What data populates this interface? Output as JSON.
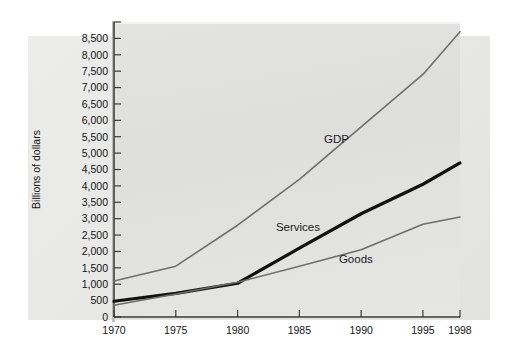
{
  "chart_data": {
    "type": "line",
    "title": "",
    "subtitle": "",
    "xlabel": "",
    "ylabel": "Billions of dollars",
    "x": [
      1970,
      1975,
      1980,
      1985,
      1990,
      1995,
      1998
    ],
    "xlim": [
      1970,
      1998
    ],
    "ylim": [
      0,
      9000
    ],
    "y_tick_step": 500,
    "grid": false,
    "legend_position": "inline-labels",
    "xticks": [
      "1970",
      "1975",
      "1980",
      "1985",
      "1990",
      "1995",
      "1998"
    ],
    "yticks": [
      "0",
      "500",
      "1,000",
      "1,500",
      "2,000",
      "2,500",
      "3,000",
      "3,500",
      "4,000",
      "4,500",
      "5,000",
      "5,500",
      "6,000",
      "6,500",
      "7,000",
      "7,500",
      "8,000",
      "8,500"
    ],
    "ytick_values": [
      0,
      500,
      1000,
      1500,
      2000,
      2500,
      3000,
      3500,
      4000,
      4500,
      5000,
      5500,
      6000,
      6500,
      7000,
      7500,
      8000,
      8500
    ],
    "extra_unlabeled_ytick": 9000,
    "series": [
      {
        "name": "GDP",
        "color": "#6e6e6e",
        "width": 1.6,
        "values": [
          1100,
          1550,
          2800,
          4200,
          5800,
          7400,
          8700
        ],
        "label_x": 1987,
        "label_y": 5300
      },
      {
        "name": "Services",
        "color": "#111111",
        "width": 3.2,
        "values": [
          480,
          720,
          1030,
          2100,
          3150,
          4050,
          4700
        ],
        "label_x": 1983.1,
        "label_y": 2620
      },
      {
        "name": "Goods",
        "color": "#6e6e6e",
        "width": 1.6,
        "values": [
          360,
          700,
          1060,
          1550,
          2050,
          2830,
          3050
        ],
        "label_x": 1988.2,
        "label_y": 1640
      }
    ]
  },
  "axis": {
    "y_title": "Billions of dollars"
  }
}
